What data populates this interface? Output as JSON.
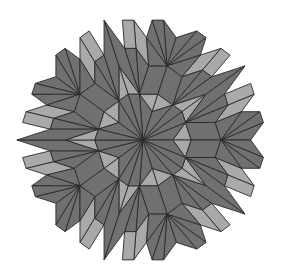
{
  "diagram": {
    "type": "penrose-kite-dart-tiling",
    "colors": {
      "kite": "#707070",
      "dart": "#a9a9a9",
      "edge": "#2a2a2a",
      "background": "#ffffff"
    },
    "tile_types": [
      "kite",
      "dart"
    ],
    "generations": 5
  }
}
